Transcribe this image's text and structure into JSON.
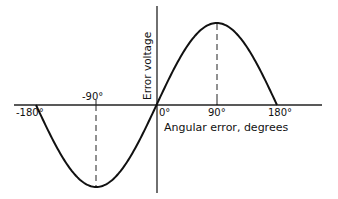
{
  "chart_data": {
    "type": "line",
    "title": "",
    "xlabel": "Angular error, degrees",
    "ylabel": "Error voltage",
    "x_ticks": [
      "-180°",
      "-90°",
      "0°",
      "90°",
      "180°"
    ],
    "x_tick_values": [
      -180,
      -90,
      0,
      90,
      180
    ],
    "xlim": [
      -180,
      180
    ],
    "ylim": [
      -1,
      1
    ],
    "grid": false,
    "legend": null,
    "series": [
      {
        "name": "Error voltage vs angular error (sine curve)",
        "x": [
          -180,
          -150,
          -120,
          -90,
          -60,
          -30,
          0,
          30,
          60,
          90,
          120,
          150,
          180
        ],
        "y": [
          0,
          -0.5,
          -0.866,
          -1,
          -0.866,
          -0.5,
          0,
          0.5,
          0.866,
          1,
          0.866,
          0.5,
          0
        ]
      }
    ],
    "annotations": [
      {
        "type": "dashed-vertical-line",
        "x": -90,
        "from_y": 0,
        "to_y": -1
      },
      {
        "type": "dashed-vertical-line",
        "x": 90,
        "from_y": 0,
        "to_y": 1
      }
    ]
  },
  "labels": {
    "ylabel": "Error voltage",
    "xlabel": "Angular error, degrees",
    "tick_neg180": "-180°",
    "tick_neg90": "-90°",
    "tick_0": "0°",
    "tick_90": "90°",
    "tick_180": "180°"
  },
  "colors": {
    "curve": "#111111",
    "axes": "#222222",
    "background": "#ffffff"
  }
}
